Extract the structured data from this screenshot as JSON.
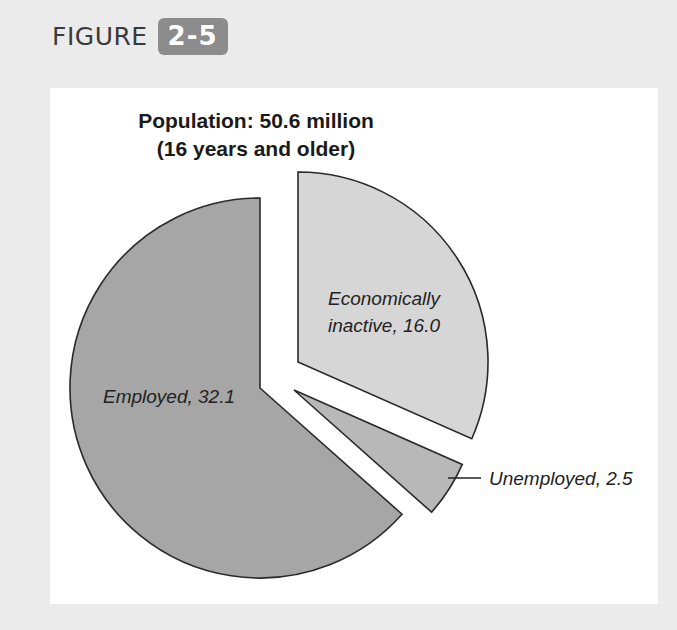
{
  "figure": {
    "word": "FIGURE",
    "number": "2-5"
  },
  "colors": {
    "page_background": "#ebebeb",
    "card_background": "#ffffff",
    "badge": "#8c8c8c",
    "employed": "#a6a6a6",
    "economically_inactive": "#d6d6d6",
    "unemployed": "#b8b8b8",
    "outline": "#2a2a2a"
  },
  "chart_data": {
    "type": "pie",
    "title": "Population: 50.6 million",
    "subtitle": "(16 years and older)",
    "total": 50.6,
    "unit": "million",
    "exploded": true,
    "slices": [
      {
        "name": "Economically inactive",
        "value": 16.0,
        "label_line1": "Economically",
        "label_line2": "inactive, 16.0"
      },
      {
        "name": "Unemployed",
        "value": 2.5,
        "label": "Unemployed, 2.5"
      },
      {
        "name": "Employed",
        "value": 32.1,
        "label": "Employed, 32.1"
      }
    ],
    "categories": [
      "Economically inactive",
      "Unemployed",
      "Employed"
    ],
    "values": [
      16.0,
      2.5,
      32.1
    ]
  }
}
